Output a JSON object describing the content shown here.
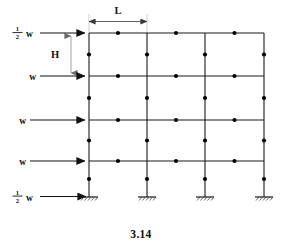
{
  "figure": {
    "caption": "3.14",
    "type": "structural-frame-diagram",
    "dimension_labels": {
      "bay_width": "L",
      "story_height": "H"
    },
    "load_labels": [
      {
        "id": "load-roof",
        "numerator": "1",
        "denominator": "2",
        "symbol": "w",
        "display": "½ w"
      },
      {
        "id": "load-level-3",
        "numerator": "",
        "denominator": "",
        "symbol": "w",
        "display": "w"
      },
      {
        "id": "load-level-2",
        "numerator": "",
        "denominator": "",
        "symbol": "w",
        "display": "w"
      },
      {
        "id": "load-level-1",
        "numerator": "",
        "denominator": "",
        "symbol": "w",
        "display": "w"
      },
      {
        "id": "load-base",
        "numerator": "1",
        "denominator": "2",
        "symbol": "w",
        "display": "½ w"
      }
    ],
    "geometry": {
      "bays": 3,
      "stories": 4,
      "column_x": [
        89,
        147,
        205,
        264
      ],
      "beam_y": [
        33,
        76,
        120,
        161
      ],
      "base_y": 197,
      "arrow_y": [
        33,
        76,
        120,
        161,
        197
      ],
      "hinge_dots_beams": true,
      "hinge_dots_columns": true,
      "support_type": "fixed"
    },
    "colors": {
      "line": "#1a1a1a",
      "dim_line": "#6f6f6f",
      "node": "#000000",
      "background": "#ffffff"
    }
  }
}
